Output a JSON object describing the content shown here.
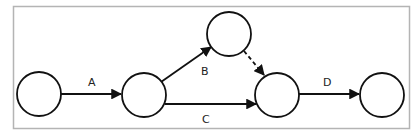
{
  "diagram": {
    "type": "activity-on-arrow network",
    "frame": {
      "x": 13,
      "y": 6,
      "width": 396,
      "height": 122,
      "stroke": "#b4b4b4"
    },
    "nodes": [
      {
        "id": "n1",
        "cx": 39,
        "cy": 94,
        "r": 22
      },
      {
        "id": "n2",
        "cx": 144,
        "cy": 95,
        "r": 22
      },
      {
        "id": "n3",
        "cx": 229,
        "cy": 34,
        "r": 22
      },
      {
        "id": "n4",
        "cx": 277,
        "cy": 95,
        "r": 22
      },
      {
        "id": "n5",
        "cx": 382,
        "cy": 95,
        "r": 22
      }
    ],
    "edges": [
      {
        "id": "A",
        "label": "A",
        "from": "n1",
        "to": "n2",
        "style": "solid",
        "label_x": 92,
        "label_y": 86
      },
      {
        "id": "B",
        "label": "B",
        "from": "n2",
        "to": "n3",
        "style": "solid",
        "label_x": 205,
        "label_y": 75
      },
      {
        "id": "dummy",
        "label": "",
        "from": "n3",
        "to": "n4",
        "style": "dashed"
      },
      {
        "id": "C",
        "label": "C",
        "from": "n2",
        "to": "n4",
        "style": "solid",
        "label_x": 206,
        "label_y": 123
      },
      {
        "id": "D",
        "label": "D",
        "from": "n4",
        "to": "n5",
        "style": "solid",
        "label_x": 327,
        "label_y": 86
      }
    ],
    "stroke_color": "#111111"
  },
  "labels": {
    "A": "A",
    "B": "B",
    "C": "C",
    "D": "D"
  }
}
